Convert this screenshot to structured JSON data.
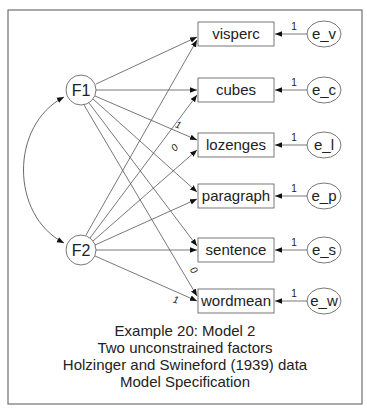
{
  "diagram": {
    "type": "path-diagram",
    "latent_factors": [
      {
        "id": "F1",
        "label": "F1",
        "cx": 81,
        "cy": 90
      },
      {
        "id": "F2",
        "label": "F2",
        "cx": 81,
        "cy": 250
      }
    ],
    "observed": [
      {
        "id": "visperc",
        "label": "visperc",
        "cy": 34
      },
      {
        "id": "cubes",
        "label": "cubes",
        "cy": 90
      },
      {
        "id": "lozenges",
        "label": "lozenges",
        "cy": 145
      },
      {
        "id": "paragraph",
        "label": "paragraph",
        "cy": 196
      },
      {
        "id": "sentence",
        "label": "sentence",
        "cy": 250
      },
      {
        "id": "wordmean",
        "label": "wordmean",
        "cy": 301
      }
    ],
    "errors": [
      {
        "id": "e_v",
        "label": "e_v",
        "weight": "1"
      },
      {
        "id": "e_c",
        "label": "e_c",
        "weight": "1"
      },
      {
        "id": "e_l",
        "label": "e_l",
        "weight": "1"
      },
      {
        "id": "e_p",
        "label": "e_p",
        "weight": "1"
      },
      {
        "id": "e_s",
        "label": "e_s",
        "weight": "1"
      },
      {
        "id": "e_w",
        "label": "e_w",
        "weight": "1"
      }
    ],
    "path_labels": [
      {
        "from": "F1",
        "to": "lozenges",
        "value": "1"
      },
      {
        "from": "F2",
        "to": "lozenges",
        "value": "0"
      },
      {
        "from": "F1",
        "to": "wordmean",
        "value": "0"
      },
      {
        "from": "F2",
        "to": "wordmean",
        "value": "1"
      }
    ],
    "covariance": {
      "between": [
        "F1",
        "F2"
      ]
    }
  },
  "caption": {
    "line1": "Example 20: Model 2",
    "line2": "Two unconstrained factors",
    "line3": "Holzinger and Swineford (1939) data",
    "line4": "Model Specification"
  }
}
